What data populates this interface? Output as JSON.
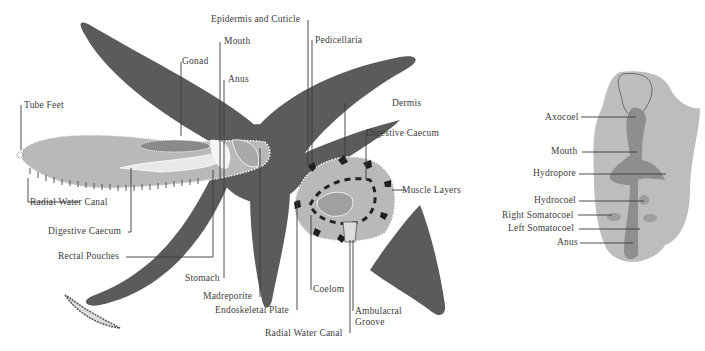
{
  "colors": {
    "body_dark": "#5b5b5b",
    "arm_section": "#b9b9b9",
    "coelom_light": "#e9e9e9",
    "larva_outer": "#bdbdbd",
    "larva_inner": "#8e8e8e",
    "leader_line": "#3a3a3a",
    "label_text": "#3c3c3c"
  },
  "starfish_labels": {
    "epidermis": "Epidermis and Cuticle",
    "mouth": "Mouth",
    "pedicellaria": "Pedicellaria",
    "gonad": "Gonad",
    "anus": "Anus",
    "tube_feet": "Tube Feet",
    "dermis": "Dermis",
    "digestive_caecum_right": "Digestive Caecum",
    "muscle_layers": "Muscle Layers",
    "radial_water_canal_left": "Radial Water Canal",
    "digestive_caecum_left": "Digestive Caecum",
    "rectal_pouches": "Rectal Pouches",
    "stomach": "Stomach",
    "madreporite": "Madreporite",
    "endoskeletal_plate": "Endoskeletal Plate",
    "coelom": "Coelom",
    "ambulacral_groove_1": "Ambulacral",
    "ambulacral_groove_2": "Groove",
    "radial_water_canal_bottom": "Radial Water Canal"
  },
  "larva_labels": {
    "axocoel": "Axocoel",
    "mouth": "Mouth",
    "hydropore": "Hydropore",
    "hydrocoel": "Hydrocoel",
    "right_somatocoel": "Right Somatocoel",
    "left_somatocoel": "Left Somatocoel",
    "anus": "Anus"
  }
}
